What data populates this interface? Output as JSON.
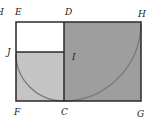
{
  "diagram": {
    "labels": {
      "cropped": "H",
      "E": "E",
      "D": "D",
      "H": "H",
      "J": "J",
      "I": "I",
      "F": "F",
      "C": "C",
      "G": "G"
    },
    "colors": {
      "outline": "#2a2a2a",
      "square_E": "#ffffff",
      "region_JF": "#c4c4c4",
      "region_DHGC": "#9e9e9e",
      "arc": "#7a7a7a"
    }
  }
}
